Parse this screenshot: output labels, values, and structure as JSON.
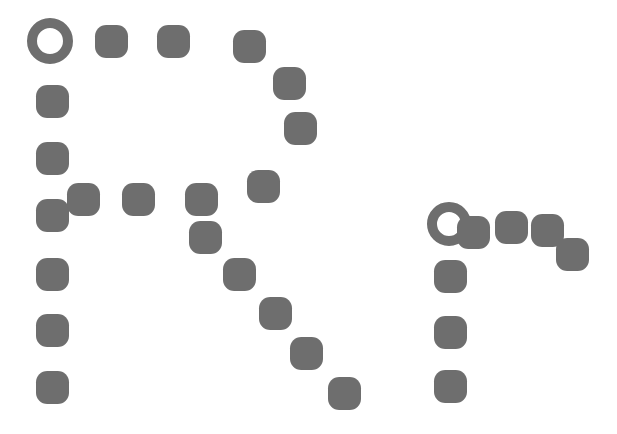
{
  "canvas": {
    "width": 617,
    "height": 434,
    "background": "#ffffff",
    "marker_color": "#6e6e6e",
    "title": "Dotted Path Diagram"
  },
  "legend": {
    "ring_meaning": "path-start-marker",
    "dot_meaning": "path-node-marker"
  },
  "chart_data": {
    "type": "scatter",
    "xlabel": "",
    "ylabel": "",
    "xlim": [
      0,
      617
    ],
    "ylim": [
      0,
      434
    ],
    "grid": false,
    "legend_position": "none",
    "marker_color": "#6e6e6e",
    "series": [
      {
        "name": "left-path-start",
        "marker": "ring",
        "points": [
          {
            "id": "L-start",
            "x": 50,
            "y": 41,
            "size": 46,
            "stroke": 10
          }
        ]
      },
      {
        "name": "left-vertical-path",
        "marker": "dot",
        "points": [
          {
            "id": "L1",
            "x": 52,
            "y": 101,
            "size": 33
          },
          {
            "id": "L2",
            "x": 52,
            "y": 158,
            "size": 33
          },
          {
            "id": "L3",
            "x": 52,
            "y": 215,
            "size": 33
          },
          {
            "id": "L4",
            "x": 52,
            "y": 274,
            "size": 33
          },
          {
            "id": "L5",
            "x": 52,
            "y": 330,
            "size": 33
          },
          {
            "id": "L6",
            "x": 52,
            "y": 387,
            "size": 33
          }
        ]
      },
      {
        "name": "top-horizontal-path",
        "marker": "dot",
        "points": [
          {
            "id": "T1",
            "x": 111,
            "y": 41,
            "size": 33
          },
          {
            "id": "T2",
            "x": 173,
            "y": 41,
            "size": 33
          },
          {
            "id": "T3",
            "x": 249,
            "y": 46,
            "size": 33
          }
        ]
      },
      {
        "name": "top-right-descent",
        "marker": "dot",
        "points": [
          {
            "id": "R1",
            "x": 289,
            "y": 83,
            "size": 33
          },
          {
            "id": "R2",
            "x": 300,
            "y": 128,
            "size": 33
          },
          {
            "id": "R3",
            "x": 263,
            "y": 186,
            "size": 33
          }
        ]
      },
      {
        "name": "mid-horizontal-path",
        "marker": "dot",
        "points": [
          {
            "id": "M1",
            "x": 83,
            "y": 199,
            "size": 33
          },
          {
            "id": "M2",
            "x": 138,
            "y": 199,
            "size": 33
          },
          {
            "id": "M3",
            "x": 201,
            "y": 199,
            "size": 33
          }
        ]
      },
      {
        "name": "mid-diagonal-descent",
        "marker": "dot",
        "points": [
          {
            "id": "D1",
            "x": 205,
            "y": 237,
            "size": 33
          },
          {
            "id": "D2",
            "x": 239,
            "y": 274,
            "size": 33
          },
          {
            "id": "D3",
            "x": 275,
            "y": 313,
            "size": 33
          },
          {
            "id": "D4",
            "x": 306,
            "y": 353,
            "size": 33
          },
          {
            "id": "D5",
            "x": 344,
            "y": 393,
            "size": 33
          }
        ]
      },
      {
        "name": "right-path-start",
        "marker": "ring",
        "points": [
          {
            "id": "R-start",
            "x": 449,
            "y": 224,
            "size": 44,
            "stroke": 10
          }
        ]
      },
      {
        "name": "right-junction",
        "marker": "dot",
        "points": [
          {
            "id": "J1",
            "x": 473,
            "y": 232,
            "size": 33
          }
        ]
      },
      {
        "name": "right-vertical-path",
        "marker": "dot",
        "points": [
          {
            "id": "RV1",
            "x": 450,
            "y": 276,
            "size": 33
          },
          {
            "id": "RV2",
            "x": 450,
            "y": 332,
            "size": 33
          },
          {
            "id": "RV3",
            "x": 450,
            "y": 386,
            "size": 33
          }
        ]
      },
      {
        "name": "right-upper-branch",
        "marker": "dot",
        "points": [
          {
            "id": "RB1",
            "x": 511,
            "y": 227,
            "size": 33
          },
          {
            "id": "RB2",
            "x": 547,
            "y": 230,
            "size": 33
          },
          {
            "id": "RB3",
            "x": 572,
            "y": 254,
            "size": 33
          }
        ]
      }
    ]
  }
}
